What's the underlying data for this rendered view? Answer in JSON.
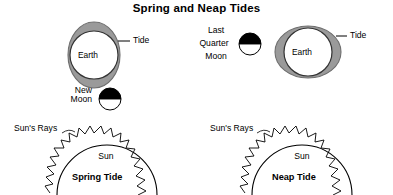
{
  "title": "Spring and Neap Tides",
  "colors": {
    "ink": "#000000",
    "bulge_gray": "#9a9a9a",
    "bulge_stroke": "#6e6e6e",
    "moon_dark": "#000000",
    "moon_light": "#ffffff",
    "background": "#ffffff"
  },
  "panels": {
    "spring": {
      "caption": "Spring Tide",
      "earth_label": "Earth",
      "tide_label": "Tide",
      "moon_label_line1": "New",
      "moon_label_line2": "Moon",
      "moon_name": "new-moon",
      "sun_label": "Sun",
      "rays_label": "Sun's Rays",
      "bulge_orientation": "vertical"
    },
    "neap": {
      "caption": "Neap Tide",
      "earth_label": "Earth",
      "tide_label": "Tide",
      "moon_label_line1": "Last",
      "moon_label_line2": "Quarter",
      "moon_label_line3": "Moon",
      "moon_name": "last-quarter-moon",
      "sun_label": "Sun",
      "rays_label": "Sun's Rays",
      "bulge_orientation": "horizontal"
    }
  }
}
